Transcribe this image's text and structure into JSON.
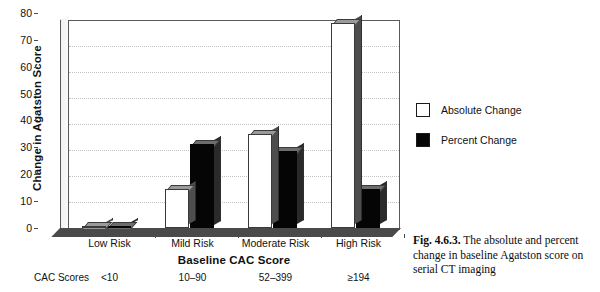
{
  "chart_data": {
    "type": "bar",
    "title": "",
    "categories": [
      "Low Risk",
      "Mild Risk",
      "Moderate Risk",
      "High Risk"
    ],
    "series": [
      {
        "name": "Absolute Change",
        "values": [
          0.5,
          15,
          36,
          79
        ],
        "color": "#ffffff"
      },
      {
        "name": "Percent Change",
        "values": [
          0.5,
          32.5,
          29.5,
          15
        ],
        "color": "#060606"
      }
    ],
    "xlabel": "Baseline CAC Score",
    "ylabel": "Change in Agatston Score",
    "ylim": [
      0,
      80
    ],
    "yticks": [
      0,
      10,
      20,
      30,
      40,
      50,
      60,
      70,
      80
    ],
    "grid": true,
    "legend_position": "right",
    "secondary_axis_label": "CAC Scores",
    "secondary_axis_values": [
      "<10",
      "10–90",
      "52–399",
      "≥194"
    ]
  },
  "axes": {
    "y_title": "Change in Agatston Score",
    "x_title": "Baseline CAC Score",
    "y_ticks": [
      "80",
      "70",
      "60",
      "50",
      "40",
      "30",
      "20",
      "10",
      "0"
    ],
    "x_ticks": [
      "Low Risk",
      "Mild Risk",
      "Moderate Risk",
      "High Risk"
    ]
  },
  "legend": {
    "items": [
      {
        "label": "Absolute Change",
        "swatch": "white"
      },
      {
        "label": "Percent Change",
        "swatch": "black"
      }
    ]
  },
  "cac_row": {
    "label": "CAC Scores",
    "values": [
      "<10",
      "10–90",
      "52–399",
      "≥194"
    ]
  },
  "caption": {
    "number": "Fig. 4.6.3.",
    "text": " The absolute and percent change in baseline Agatston score on serial CT imaging"
  }
}
